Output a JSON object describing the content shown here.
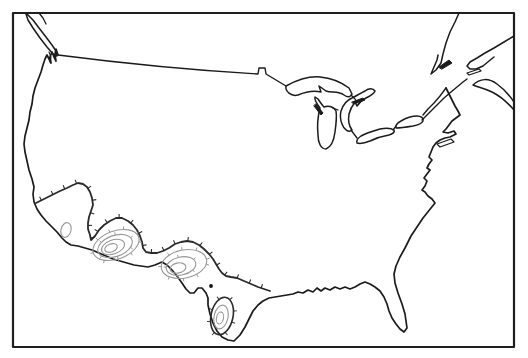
{
  "figure": {
    "kind": "map-figure",
    "canvas": {
      "width": 528,
      "height": 358,
      "background": "#ffffff"
    },
    "colors": {
      "outline": "#1b1b1b",
      "frame": "#1f1f1f",
      "contour_major": "#2a2a2a",
      "contour_minor": "#989898",
      "marker": "#111111"
    },
    "layers": [
      {
        "name": "map-frame",
        "kind": "rect",
        "x": 13,
        "y": 13,
        "w": 501,
        "h": 334,
        "stroke": "#1f1f1f",
        "width": 2.2
      },
      {
        "name": "canada-border-line",
        "kind": "path",
        "stroke": "#1b1b1b",
        "width": 1.4,
        "d": "M58,55 C120,63 190,70 258,74 L259,68 L265,68 L266,74 L271,77 L276,80 L281,83 L286,86"
      },
      {
        "name": "us-coast-outline",
        "kind": "path",
        "stroke": "#1b1b1b",
        "width": 1.7,
        "d": "M446,88 L449,94 L452,100 L455,106 L458,111 L460,115 L456,118 L452,121 L449,125 L446,129 L443,132 L448,133 L454,131 L456,134 L450,137 L445,138 L440,140 L436,143 L433,147 L431,152 L429,157 L432,160 L429,164 L427,168 L430,170 L427,174 L424,178 L427,181 L425,186 L422,190 L425,192 L428,196 L432,199 L435,203 L431,208 L427,213 L423,218 L419,224 L415,230 L411,236 L409,240 L405,248 L400,257 L396,266 L394,274 L395,283 L398,293 L402,304 L405,314 L406,321 L407,328 L404,332 L400,329 L396,324 L392,318 L389,311 L387,304 L384,297 L380,291 L375,287 L370,284 L365,282 L360,284 L355,287 L350,289 L345,287 L340,289 L335,287 L330,290 L325,288 L321,291 L317,288 L313,292 L308,290 L303,293 L298,292 L293,294 L287,295 L281,296 L275,297 L269,298 L263,301 L258,305 L253,311 L249,319 L245,327 L240,335 L234,341 L228,340 L222,337 L217,331 L213,323 L210,314 L208,305 L208,298 L206,293 L202,288 L198,288 L194,293 L190,293 L186,289 L182,283 L177,276 L172,270 L167,265 L162,262 L155,265 L148,267 L141,266 L134,265 L127,263 L120,261 L113,259 L106,256 L99,253 L92,250 L85,248 L78,246 L71,245 L66,242 L62,238 L57,232 L51,226 L46,221 L41,215 L37,209 L34,202 L33,194 L34,187 L32,179 L29,170 L27,161 L25,152 L24,144 L25,136 L27,128 L29,120 L30,112 L32,104 L33,96 L35,88 L38,80 L41,72 L43,65 L45,59 L47,55 L49,59 L51,63 L50,57 L52,52 L54,57 L56,61 L55,54 L56,49 L58,55"
      },
      {
        "name": "vancouver-island",
        "kind": "path",
        "stroke": "#1b1b1b",
        "width": 1.5,
        "d": "M27,14 L33,20 L39,28 L46,37 L52,45 L56,51 L57,56 L53,54 L47,47 L40,38 L33,28 L28,20 L26,14 Z"
      },
      {
        "name": "bc-coast-line",
        "kind": "path",
        "stroke": "#1b1b1b",
        "width": 1.3,
        "d": "M39,13 L43,18 L46,24"
      },
      {
        "name": "puget-sound-inlet",
        "kind": "path",
        "stroke": "#1b1b1b",
        "width": 1.1,
        "d": "M49,52 L51,57 L50,62"
      },
      {
        "name": "lake-superior",
        "kind": "path",
        "stroke": "#1b1b1b",
        "width": 1.5,
        "d": "M286,86 C297,80 309,76 320,77 C331,78 341,82 349,88 L352,94 C351,97 348,98 344,95 C338,91 332,93 326,91 L319,86 L321,92 C313,90 305,92 298,95 C291,97 285,91 286,86 Z"
      },
      {
        "name": "lake-michigan",
        "kind": "path",
        "stroke": "#1b1b1b",
        "width": 1.5,
        "d": "M320,108 C317,104 314,100 315,97 L318,99 C320,102 322,105 324,107 C329,105 334,107 336,111 C337,117 336,125 335,132 C334,140 331,147 326,149 C321,149 318,143 318,135 C317,126 318,116 320,108 Z"
      },
      {
        "name": "green-bay-sliver",
        "kind": "path",
        "stroke": "#1b1b1b",
        "width": 1,
        "fill": "#1b1b1b",
        "d": "M316,104 L323,113 L321,115 L314,106 Z"
      },
      {
        "name": "lake-huron",
        "kind": "path",
        "stroke": "#1b1b1b",
        "width": 1.5,
        "d": "M341,111 C343,105 347,100 352,98 C356,96 361,93 365,91 C369,88 373,88 375,91 C374,94 370,96 366,98 C362,100 359,103 357,106 L355,102 C352,106 350,110 349,114 C348,120 349,126 352,130 C349,133 344,130 342,124 C340,119 340,115 341,111 Z"
      },
      {
        "name": "manitoulin-sliver",
        "kind": "path",
        "stroke": "#1b1b1b",
        "width": 1,
        "fill": "#1b1b1b",
        "d": "M352,102 L363,98 L365,100 L354,104 Z"
      },
      {
        "name": "sault-channel",
        "kind": "path",
        "stroke": "#1b1b1b",
        "width": 1.3,
        "d": "M351,95 L355,99 L357,102"
      },
      {
        "name": "mackinac-channel",
        "kind": "path",
        "stroke": "#1b1b1b",
        "width": 1.3,
        "d": "M338,110 L333,108"
      },
      {
        "name": "stclair-channel",
        "kind": "path",
        "stroke": "#1b1b1b",
        "width": 1.3,
        "d": "M351,130 L354,134 L357,138"
      },
      {
        "name": "lake-erie",
        "kind": "path",
        "stroke": "#1b1b1b",
        "width": 1.5,
        "d": "M357,143 C356,140 358,138 361,136 C366,133 373,131 380,129 C386,128 391,128 394,130 C395,132 393,134 389,135 C383,136 376,138 370,141 C365,143 360,144 357,143 Z"
      },
      {
        "name": "niagara-channel",
        "kind": "path",
        "stroke": "#1b1b1b",
        "width": 1.3,
        "d": "M393,130 L396,126"
      },
      {
        "name": "lake-ontario",
        "kind": "path",
        "stroke": "#1b1b1b",
        "width": 1.5,
        "d": "M396,128 C395,126 397,123 401,121 C406,118 412,116 417,116 C421,116 424,118 423,121 C422,123 418,125 413,126 C407,127 401,128 396,128 Z"
      },
      {
        "name": "st-lawrence-south-shore",
        "kind": "path",
        "stroke": "#1b1b1b",
        "width": 1.4,
        "d": "M422,120 L430,112 L437,105 L444,98 L451,92 L457,87 L463,82 L467,79"
      },
      {
        "name": "st-lawrence-north-shore",
        "kind": "path",
        "stroke": "#1b1b1b",
        "width": 1.5,
        "d": "M459,13 L455,22 L450,32 L446,43 L443,54 L441,63 L436,70 L431,74 L434,67 L437,60 L438,55"
      },
      {
        "name": "anticosti-island",
        "kind": "path",
        "stroke": "#1b1b1b",
        "width": 1,
        "fill": "#1b1b1b",
        "d": "M439,67 L449,60 L452,63 L442,69 Z"
      },
      {
        "name": "gaspe-peninsula",
        "kind": "path",
        "stroke": "#1b1b1b",
        "width": 1.5,
        "d": "M514,36 L504,42 L494,48 L485,53 L477,58 L470,62 L467,66 L470,69 L476,69 L483,66 L489,61 L494,57"
      },
      {
        "name": "prince-edward-island",
        "kind": "path",
        "stroke": "#1b1b1b",
        "width": 1.2,
        "d": "M467,73 L479,69 L481,71 L469,75 Z"
      },
      {
        "name": "nova-scotia",
        "kind": "path",
        "stroke": "#1b1b1b",
        "width": 1.5,
        "d": "M473,85 C480,78 489,78 497,84 C504,89 510,96 514,102 L514,110 C508,103 500,96 492,92 C484,88 477,87 473,85 Z"
      },
      {
        "name": "maine-border",
        "kind": "path",
        "stroke": "#1b1b1b",
        "width": 1.4,
        "d": "M446,88 L440,96 L434,103 L428,109 L423,115"
      },
      {
        "name": "long-island",
        "kind": "path",
        "stroke": "#1b1b1b",
        "width": 1.2,
        "d": "M437,144 L451,139 L454,142 L440,147 Z"
      },
      {
        "name": "density-contour-outer",
        "kind": "path",
        "stroke": "#2a2a2a",
        "width": 1.8,
        "ticks": {
          "spacing": 13,
          "len": 4,
          "offset": 6
        },
        "d": "M36,203 L44,199 L52,195 L60,191 L67,188 L73,185 L78,183 L83,184 L87,187 L90,192 L92,198 L93,205 L91,211 L89,217 L88,223 L88,229 L90,235 L91,240 L95,236 L99,230 L104,225 L110,221 L116,218 L122,218 L128,221 L133,225 L137,230 L140,236 L142,242 L143,248 L146,252 L151,253 L157,253 L163,251 L169,248 L175,244 L181,242 L187,241 L193,242 L199,245 L204,249 L209,254 L213,259 L216,264 L219,269 L222,273 L226,276 L231,277 L237,278 L244,281 L251,284 L258,287 L264,289 L270,291"
      },
      {
        "name": "stx-contour-ring-1",
        "kind": "ellipse",
        "cx": 222,
        "cy": 316,
        "rx": 11,
        "ry": 19,
        "rot": 12,
        "stroke": "#2a2a2a",
        "width": 1.6,
        "ticks": {
          "spacing": 12,
          "len": 3.5,
          "offset": 4
        }
      },
      {
        "name": "stx-contour-ring-2",
        "kind": "ellipse",
        "cx": 221,
        "cy": 317,
        "rx": 7,
        "ry": 12,
        "rot": 12,
        "stroke": "#989898",
        "width": 1.1
      },
      {
        "name": "stx-contour-ring-3",
        "kind": "ellipse",
        "cx": 220,
        "cy": 318,
        "rx": 3.5,
        "ry": 6,
        "rot": 12,
        "stroke": "#989898",
        "width": 1.1
      },
      {
        "name": "az-contour-ring-1",
        "kind": "ellipse",
        "cx": 116,
        "cy": 245,
        "rx": 24,
        "ry": 14,
        "rot": -20,
        "stroke": "#989898",
        "width": 1.1,
        "ticks": {
          "spacing": 14,
          "len": 3,
          "offset": 5
        }
      },
      {
        "name": "az-contour-ring-2",
        "kind": "ellipse",
        "cx": 115,
        "cy": 246,
        "rx": 18,
        "ry": 10.5,
        "rot": -20,
        "stroke": "#989898",
        "width": 1.1,
        "ticks": {
          "spacing": 16,
          "len": 2.6,
          "offset": 8
        }
      },
      {
        "name": "az-contour-ring-3",
        "kind": "ellipse",
        "cx": 113,
        "cy": 247,
        "rx": 12,
        "ry": 7,
        "rot": -20,
        "stroke": "#989898",
        "width": 1.1
      },
      {
        "name": "az-contour-ring-4",
        "kind": "ellipse",
        "cx": 111,
        "cy": 248,
        "rx": 6.5,
        "ry": 4,
        "rot": -20,
        "stroke": "#989898",
        "width": 1.1
      },
      {
        "name": "yuma-contour-loop",
        "kind": "ellipse",
        "cx": 66,
        "cy": 230,
        "rx": 5,
        "ry": 7.5,
        "rot": 15,
        "stroke": "#989898",
        "width": 1.1
      },
      {
        "name": "wtx-contour-ring-1",
        "kind": "ellipse",
        "cx": 184,
        "cy": 264,
        "rx": 23,
        "ry": 14,
        "rot": -12,
        "stroke": "#989898",
        "width": 1.1,
        "ticks": {
          "spacing": 14,
          "len": 3,
          "offset": 5
        }
      },
      {
        "name": "wtx-contour-ring-2",
        "kind": "ellipse",
        "cx": 181,
        "cy": 266,
        "rx": 15,
        "ry": 9,
        "rot": -12,
        "stroke": "#989898",
        "width": 1.1,
        "ticks": {
          "spacing": 16,
          "len": 2.6,
          "offset": 8
        }
      },
      {
        "name": "wtx-contour-ring-3",
        "kind": "ellipse",
        "cx": 178,
        "cy": 268,
        "rx": 8,
        "ry": 5,
        "rot": -12,
        "stroke": "#989898",
        "width": 1.1
      },
      {
        "name": "locality-point-marker",
        "kind": "circle",
        "cx": 211,
        "cy": 286,
        "r": 1.9,
        "fill": "#111111",
        "stroke": "none",
        "width": 0
      }
    ]
  }
}
